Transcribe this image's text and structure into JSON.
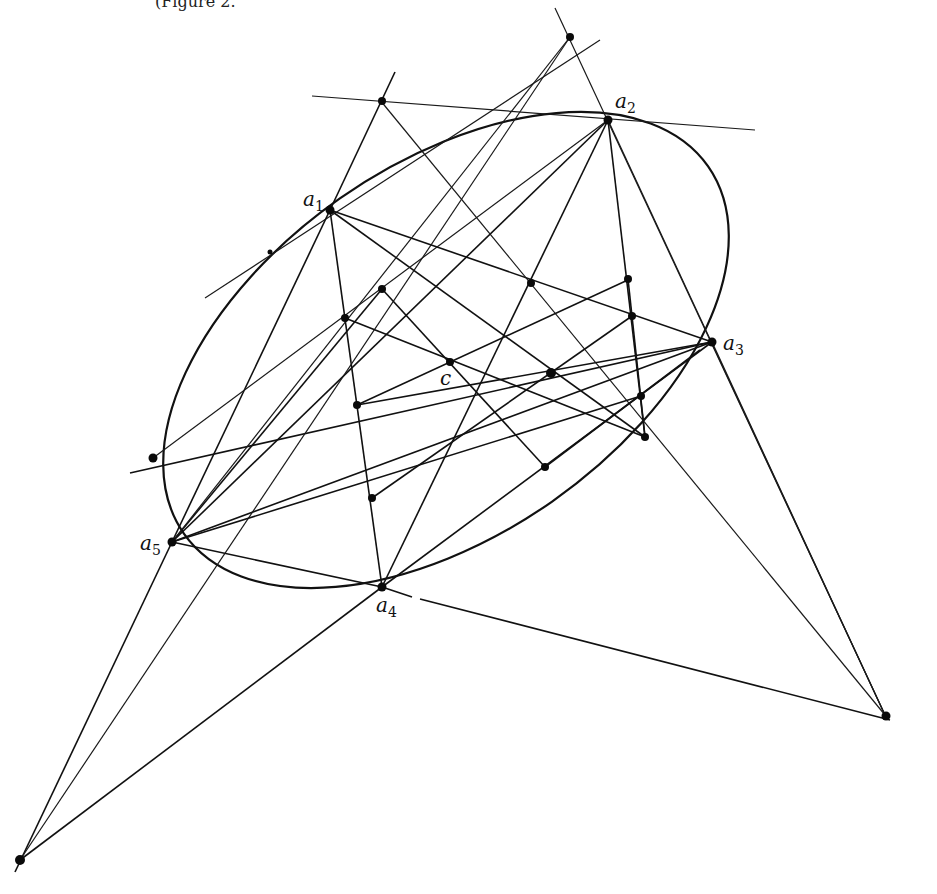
{
  "caption_fragment": "(Figure 2.",
  "labels": {
    "a1": {
      "main": "a",
      "sub": "1"
    },
    "a2": {
      "main": "a",
      "sub": "2"
    },
    "a3": {
      "main": "a",
      "sub": "3"
    },
    "a4": {
      "main": "a",
      "sub": "4"
    },
    "a5": {
      "main": "a",
      "sub": "5"
    },
    "c": "c"
  },
  "points": {
    "a1": [
      330,
      210
    ],
    "a2": [
      608,
      120
    ],
    "a3": [
      712,
      342
    ],
    "a4": [
      382,
      587
    ],
    "a5": [
      172,
      542
    ],
    "c": [
      450,
      362
    ]
  },
  "colors": {
    "ink": "#111111",
    "background": "#ffffff"
  }
}
